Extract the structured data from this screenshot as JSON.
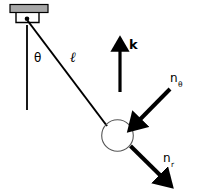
{
  "figure": {
    "background_color": "#ffffff",
    "stroke_color": "#000000",
    "mount_fill_color": "#a8a8a8",
    "width": 198,
    "height": 190
  },
  "labels": {
    "angle": "θ",
    "length": "ℓ",
    "vertical_unit_vector": "k",
    "tangential_unit_vector_base": "n",
    "tangential_unit_vector_sub": "θ",
    "radial_unit_vector_base": "n",
    "radial_unit_vector_sub": "r"
  },
  "geometry": {
    "pivot": {
      "x": 27,
      "y": 19
    },
    "bob_center": {
      "x": 117.5,
      "y": 135.5
    },
    "bob_radius": 16,
    "string": {
      "x1": 27,
      "y1": 19,
      "x2": 107,
      "y2": 126
    },
    "vertical_reference": {
      "x1": 27,
      "y1": 25,
      "x2": 27,
      "y2": 110
    },
    "mount_plate": {
      "x": 10,
      "y": 5,
      "width": 38,
      "height": 8
    },
    "k_arrow": {
      "x1": 120,
      "y1": 92,
      "x2": 120,
      "y2": 44
    },
    "n_theta_arrow": {
      "x1": 171,
      "y1": 88,
      "x2": 136,
      "y2": 123
    },
    "n_r_arrow": {
      "x1": 131,
      "y1": 146,
      "x2": 165,
      "y2": 180
    }
  }
}
